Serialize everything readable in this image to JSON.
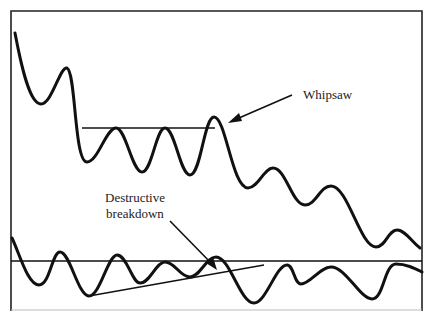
{
  "diagram": {
    "type": "technical-analysis-illustration",
    "colors": {
      "line": "#111111",
      "background": "#ffffff",
      "text": "#222222"
    },
    "annotations": {
      "whipsaw": "Whipsaw",
      "destructive_line1": "Destructive",
      "destructive_line2": "breakdown"
    },
    "upper_panel": {
      "description": "Price series with horizontal resistance line; false breakout labeled Whipsaw",
      "resistance_level_y": 128
    },
    "lower_panel": {
      "description": "Oscillator with horizontal reference line and rising trendline; breakdown below trendline labeled Destructive breakdown",
      "reference_level_y": 261
    }
  }
}
